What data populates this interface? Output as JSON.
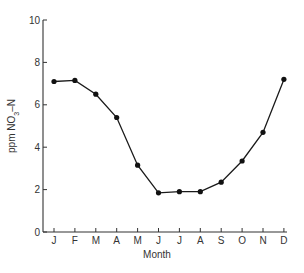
{
  "chart_data": {
    "type": "line",
    "title": "",
    "xlabel": "Month",
    "ylabel": "ppm NO3-N",
    "ylabel_parts": {
      "pre": "ppm  NO",
      "sub": "3",
      "post": "–N"
    },
    "categories": [
      "J",
      "F",
      "M",
      "A",
      "M",
      "J",
      "J",
      "A",
      "S",
      "O",
      "N",
      "D"
    ],
    "series": [
      {
        "name": "NO3-N",
        "values": [
          7.1,
          7.15,
          6.5,
          5.4,
          3.15,
          1.85,
          1.9,
          1.9,
          2.35,
          3.35,
          4.7,
          7.2
        ]
      }
    ],
    "ylim": [
      0,
      10
    ],
    "yticks": [
      0,
      2,
      4,
      6,
      8,
      10
    ],
    "grid": false,
    "legend": null
  }
}
